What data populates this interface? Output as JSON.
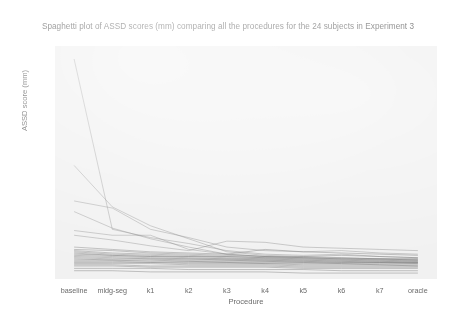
{
  "chart_data": {
    "type": "line",
    "title": "Spaghetti plot of ASSD scores (mm) comparing all the procedures for the 24 subjects in Experiment 3",
    "xlabel": "Procedure",
    "ylabel": "ASSD score (mm)",
    "grid": false,
    "legend": false,
    "categories": [
      "baseline",
      "mldg-seg",
      "k1",
      "k2",
      "k3",
      "k4",
      "k5",
      "k6",
      "k7",
      "oracle"
    ],
    "yticks": [
      "2.5",
      "5.0",
      "7.5",
      "10.0",
      "12.5",
      "15.0",
      "17.5",
      "20.0"
    ],
    "ytick_values": [
      2.5,
      5.0,
      7.5,
      10.0,
      12.5,
      15.0,
      17.5,
      20.0
    ],
    "ylim": [
      0.9,
      20.6
    ],
    "series": [
      {
        "name": "subject-01",
        "values": [
          19.5,
          5.1,
          4.4,
          3.9,
          3.3,
          3.0,
          2.9,
          3.0,
          2.8,
          2.7
        ]
      },
      {
        "name": "subject-02",
        "values": [
          10.5,
          7.0,
          5.4,
          4.3,
          3.2,
          2.9,
          2.8,
          2.7,
          2.6,
          2.6
        ]
      },
      {
        "name": "subject-03",
        "values": [
          7.5,
          6.9,
          5.1,
          4.4,
          3.6,
          3.3,
          3.2,
          3.3,
          3.1,
          3.0
        ]
      },
      {
        "name": "subject-04",
        "values": [
          6.6,
          5.2,
          4.3,
          3.6,
          3.0,
          2.8,
          2.7,
          2.7,
          2.6,
          2.5
        ]
      },
      {
        "name": "subject-05",
        "values": [
          5.0,
          4.6,
          4.6,
          3.4,
          3.0,
          2.8,
          2.7,
          2.6,
          2.6,
          2.5
        ]
      },
      {
        "name": "subject-06",
        "values": [
          4.6,
          4.2,
          3.7,
          3.3,
          4.1,
          4.0,
          3.6,
          3.5,
          3.4,
          3.3
        ]
      },
      {
        "name": "subject-07",
        "values": [
          3.6,
          3.4,
          3.2,
          3.1,
          3.0,
          3.4,
          3.2,
          3.1,
          3.0,
          2.9
        ]
      },
      {
        "name": "subject-08",
        "values": [
          3.4,
          3.3,
          3.1,
          3.0,
          2.9,
          2.8,
          2.8,
          2.9,
          2.8,
          2.7
        ]
      },
      {
        "name": "subject-09",
        "values": [
          3.3,
          3.1,
          3.0,
          2.9,
          2.8,
          2.7,
          2.7,
          2.6,
          2.6,
          2.6
        ]
      },
      {
        "name": "subject-10",
        "values": [
          3.2,
          3.0,
          2.9,
          2.8,
          2.8,
          2.7,
          2.6,
          2.6,
          2.5,
          2.5
        ]
      },
      {
        "name": "subject-11",
        "values": [
          3.1,
          2.9,
          2.8,
          2.8,
          2.7,
          2.6,
          2.6,
          2.5,
          2.5,
          2.4
        ]
      },
      {
        "name": "subject-12",
        "values": [
          3.0,
          2.9,
          2.8,
          2.7,
          2.6,
          2.6,
          2.5,
          2.5,
          2.4,
          2.4
        ]
      },
      {
        "name": "subject-13",
        "values": [
          2.9,
          2.8,
          2.7,
          2.6,
          2.6,
          2.5,
          2.5,
          2.4,
          2.4,
          2.3
        ]
      },
      {
        "name": "subject-14",
        "values": [
          2.8,
          2.7,
          2.6,
          2.6,
          2.5,
          2.5,
          2.4,
          2.4,
          2.3,
          2.3
        ]
      },
      {
        "name": "subject-15",
        "values": [
          2.7,
          2.6,
          2.6,
          2.5,
          2.5,
          2.4,
          2.4,
          2.3,
          2.3,
          2.3
        ]
      },
      {
        "name": "subject-16",
        "values": [
          2.6,
          2.5,
          2.5,
          2.4,
          2.4,
          2.4,
          2.3,
          2.3,
          2.3,
          2.2
        ]
      },
      {
        "name": "subject-17",
        "values": [
          2.5,
          2.5,
          2.4,
          2.4,
          2.3,
          2.3,
          2.3,
          2.2,
          2.2,
          2.2
        ]
      },
      {
        "name": "subject-18",
        "values": [
          2.4,
          2.4,
          2.3,
          2.3,
          2.3,
          2.2,
          2.2,
          2.2,
          2.1,
          2.1
        ]
      },
      {
        "name": "subject-19",
        "values": [
          2.3,
          2.3,
          2.3,
          2.2,
          2.2,
          2.2,
          2.1,
          2.1,
          2.1,
          2.0
        ]
      },
      {
        "name": "subject-20",
        "values": [
          2.2,
          2.2,
          2.2,
          2.1,
          2.1,
          2.1,
          2.0,
          2.0,
          2.0,
          2.0
        ]
      },
      {
        "name": "subject-21",
        "values": [
          2.1,
          2.1,
          2.0,
          2.0,
          2.0,
          2.0,
          1.9,
          1.9,
          1.9,
          1.9
        ]
      },
      {
        "name": "subject-22",
        "values": [
          2.0,
          2.0,
          1.9,
          1.9,
          1.9,
          1.9,
          1.8,
          1.8,
          1.8,
          1.8
        ]
      },
      {
        "name": "subject-23",
        "values": [
          1.8,
          1.8,
          1.8,
          1.7,
          1.7,
          1.7,
          1.7,
          1.6,
          1.6,
          1.6
        ]
      },
      {
        "name": "subject-24",
        "values": [
          1.6,
          1.6,
          1.5,
          1.5,
          1.5,
          1.5,
          1.4,
          1.4,
          1.4,
          1.4
        ]
      }
    ]
  }
}
